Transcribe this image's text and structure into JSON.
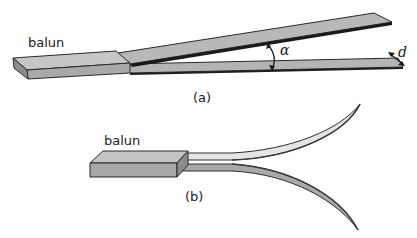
{
  "figure": {
    "panel_a": {
      "caption": "(a)",
      "balun_label": "balun",
      "angle_label": "α",
      "spacing_label": "d",
      "description": "Two flat strip conductors leaving a balun block, diverging at angle alpha, with strip width d"
    },
    "panel_b": {
      "caption": "(b)",
      "balun_label": "balun",
      "description": "Two curved strip conductors flaring outward from a balun block (exponential taper)"
    },
    "colors": {
      "fill_light": "#c8c8c8",
      "fill_mid": "#aeaeae",
      "fill_dark": "#8e8e8e",
      "edge": "#2a2a2a",
      "strip_light": "#e2e2e2"
    }
  }
}
